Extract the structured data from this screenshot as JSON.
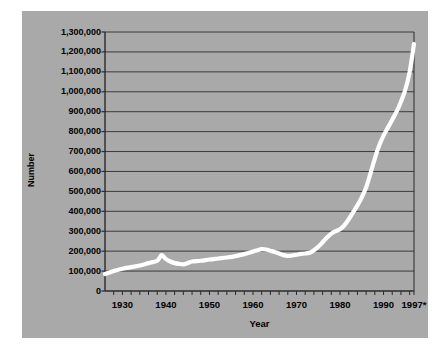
{
  "figure": {
    "background_color": "#ffffff",
    "panel_color": "#a9a9a9",
    "line_color": "#ffffff",
    "grid_color": "#3a3a3a",
    "axis_color": "#2b2b2b"
  },
  "chart_data": {
    "type": "line",
    "title": "",
    "xlabel": "Year",
    "ylabel": "Number",
    "xlim": [
      1926,
      1997
    ],
    "ylim": [
      0,
      1300000
    ],
    "grid": true,
    "legend": "none",
    "y_ticks": [
      0,
      100000,
      200000,
      300000,
      400000,
      500000,
      600000,
      700000,
      800000,
      900000,
      1000000,
      1100000,
      1200000,
      1300000
    ],
    "y_tick_labels": [
      "0",
      "100,000",
      "200,000",
      "300,000",
      "400,000",
      "500,000",
      "600,000",
      "700,000",
      "800,000",
      "900,000",
      "1,000,000",
      "1,100,000",
      "1,200,000",
      "1,300,000"
    ],
    "x_ticks": [
      1930,
      1940,
      1950,
      1960,
      1970,
      1980,
      1990,
      1997
    ],
    "x_tick_labels": [
      "1930",
      "1940",
      "1950",
      "1960",
      "1970",
      "1980",
      "1990",
      "1997*"
    ],
    "x_minor_tick_step": 2,
    "series": [
      {
        "name": "Number",
        "x": [
          1926,
          1928,
          1930,
          1932,
          1934,
          1936,
          1938,
          1939,
          1940,
          1941,
          1942,
          1943,
          1944,
          1945,
          1946,
          1948,
          1950,
          1952,
          1954,
          1956,
          1958,
          1960,
          1961,
          1962,
          1963,
          1964,
          1965,
          1966,
          1967,
          1968,
          1969,
          1970,
          1971,
          1972,
          1973,
          1974,
          1975,
          1976,
          1977,
          1978,
          1979,
          1980,
          1981,
          1982,
          1983,
          1984,
          1985,
          1986,
          1987,
          1988,
          1989,
          1990,
          1991,
          1992,
          1993,
          1994,
          1995,
          1996,
          1997
        ],
        "y": [
          85000,
          100000,
          112000,
          120000,
          128000,
          140000,
          152000,
          180000,
          160000,
          148000,
          140000,
          136000,
          134000,
          140000,
          148000,
          152000,
          158000,
          163000,
          168000,
          175000,
          185000,
          198000,
          205000,
          210000,
          208000,
          202000,
          196000,
          188000,
          180000,
          176000,
          178000,
          182000,
          186000,
          188000,
          192000,
          205000,
          222000,
          245000,
          268000,
          288000,
          300000,
          310000,
          330000,
          360000,
          395000,
          430000,
          470000,
          520000,
          590000,
          665000,
          730000,
          780000,
          820000,
          860000,
          900000,
          950000,
          1010000,
          1100000,
          1240000
        ]
      }
    ]
  },
  "axis": {
    "y_title": "Number",
    "x_title": "Year"
  }
}
